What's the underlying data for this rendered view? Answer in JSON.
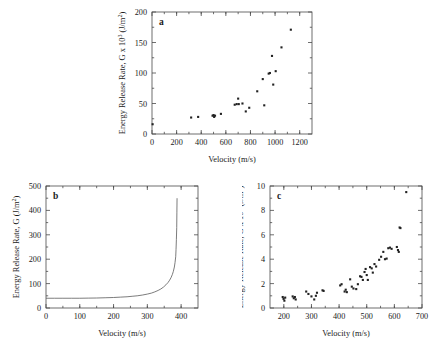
{
  "figure": {
    "background_color": "#ffffff",
    "ink_color": "#1a1a1a",
    "axis_color": "#4a4a4a",
    "panel_count": 3
  },
  "chart_data": [
    {
      "type": "scatter",
      "panel_label": "a",
      "title": "",
      "xlabel": "Velocity (m/s)",
      "ylabel": "Energy Release Rate, G x 10³ (J/m²)",
      "ylabel_parts": {
        "base": "Energy Release Rate, G x 10",
        "exponent": "3",
        "units": " (J/m",
        "units_exponent": "2",
        "units_close": ")"
      },
      "xlim": [
        0,
        1300
      ],
      "ylim": [
        0,
        200
      ],
      "xticks": [
        0,
        200,
        400,
        600,
        800,
        1000,
        1200
      ],
      "yticks": [
        0,
        50,
        100,
        150,
        200
      ],
      "grid": false,
      "legend": "none",
      "marker": "square",
      "points": [
        {
          "x": 5,
          "y": 16
        },
        {
          "x": 318,
          "y": 27
        },
        {
          "x": 375,
          "y": 28
        },
        {
          "x": 492,
          "y": 30
        },
        {
          "x": 500,
          "y": 31
        },
        {
          "x": 505,
          "y": 28
        },
        {
          "x": 512,
          "y": 30
        },
        {
          "x": 560,
          "y": 33
        },
        {
          "x": 672,
          "y": 48
        },
        {
          "x": 688,
          "y": 49
        },
        {
          "x": 700,
          "y": 58
        },
        {
          "x": 705,
          "y": 49
        },
        {
          "x": 735,
          "y": 50
        },
        {
          "x": 762,
          "y": 37
        },
        {
          "x": 790,
          "y": 43
        },
        {
          "x": 855,
          "y": 70
        },
        {
          "x": 900,
          "y": 90
        },
        {
          "x": 912,
          "y": 47
        },
        {
          "x": 948,
          "y": 99
        },
        {
          "x": 958,
          "y": 100
        },
        {
          "x": 975,
          "y": 128
        },
        {
          "x": 985,
          "y": 81
        },
        {
          "x": 1005,
          "y": 103
        },
        {
          "x": 1052,
          "y": 142
        },
        {
          "x": 1128,
          "y": 171
        }
      ]
    },
    {
      "type": "line",
      "panel_label": "b",
      "title": "",
      "xlabel": "Velocity (m/s)",
      "ylabel": "Energy Release Rate, G (J/m²)",
      "ylabel_parts": {
        "base": "Energy Release Rate, G (J/m",
        "units_exponent": "2",
        "units_close": ")"
      },
      "xlim": [
        0,
        450
      ],
      "ylim": [
        0,
        500
      ],
      "xticks": [
        0,
        100,
        200,
        300,
        400
      ],
      "yticks": [
        0,
        100,
        200,
        300,
        400,
        500
      ],
      "grid": false,
      "legend": "none",
      "asymptote_x": 388,
      "baseline_y": 40,
      "x": [
        0,
        25,
        50,
        75,
        100,
        125,
        150,
        175,
        200,
        220,
        240,
        255,
        270,
        285,
        300,
        312,
        322,
        332,
        340,
        348,
        355,
        361,
        366,
        370,
        374,
        377,
        380,
        382,
        384,
        385,
        386,
        387,
        387.5,
        388
      ],
      "y": [
        40,
        40,
        40,
        40,
        40,
        40.5,
        41,
        42,
        43,
        44.5,
        46,
        48,
        50,
        53,
        57,
        61,
        66,
        72,
        78,
        86,
        95,
        104,
        114,
        124,
        137,
        150,
        168,
        186,
        210,
        240,
        280,
        330,
        390,
        450
      ]
    },
    {
      "type": "scatter",
      "panel_label": "c",
      "title": "",
      "xlabel": "Velocity (m/s)",
      "ylabel": "Energy Release Rate, G x 10³ (J/m²)",
      "ylabel_parts": {
        "base": "Energy Release Rate, G x 10",
        "exponent": "3",
        "units": " (J/m",
        "units_exponent": "2",
        "units_close": ")"
      },
      "xlim": [
        150,
        700
      ],
      "ylim": [
        0,
        10
      ],
      "xticks": [
        200,
        300,
        400,
        500,
        600,
        700
      ],
      "yticks": [
        0,
        2,
        4,
        6,
        8,
        10
      ],
      "grid": false,
      "legend": "none",
      "marker": "square",
      "points": [
        {
          "x": 196,
          "y": 0.9
        },
        {
          "x": 199,
          "y": 0.75
        },
        {
          "x": 202,
          "y": 0.6
        },
        {
          "x": 205,
          "y": 0.85
        },
        {
          "x": 232,
          "y": 0.95
        },
        {
          "x": 236,
          "y": 0.8
        },
        {
          "x": 240,
          "y": 0.9
        },
        {
          "x": 243,
          "y": 0.7
        },
        {
          "x": 281,
          "y": 1.35
        },
        {
          "x": 289,
          "y": 1.15
        },
        {
          "x": 300,
          "y": 0.95
        },
        {
          "x": 310,
          "y": 0.7
        },
        {
          "x": 316,
          "y": 1.0
        },
        {
          "x": 320,
          "y": 1.25
        },
        {
          "x": 340,
          "y": 1.45
        },
        {
          "x": 344,
          "y": 1.4
        },
        {
          "x": 404,
          "y": 1.85
        },
        {
          "x": 409,
          "y": 1.95
        },
        {
          "x": 420,
          "y": 1.35
        },
        {
          "x": 424,
          "y": 1.5
        },
        {
          "x": 428,
          "y": 1.3
        },
        {
          "x": 440,
          "y": 2.35
        },
        {
          "x": 446,
          "y": 1.75
        },
        {
          "x": 452,
          "y": 1.6
        },
        {
          "x": 462,
          "y": 1.55
        },
        {
          "x": 468,
          "y": 1.95
        },
        {
          "x": 476,
          "y": 2.6
        },
        {
          "x": 481,
          "y": 2.55
        },
        {
          "x": 486,
          "y": 2.3
        },
        {
          "x": 492,
          "y": 2.95
        },
        {
          "x": 496,
          "y": 3.2
        },
        {
          "x": 500,
          "y": 2.7
        },
        {
          "x": 504,
          "y": 2.3
        },
        {
          "x": 512,
          "y": 3.35
        },
        {
          "x": 518,
          "y": 3.25
        },
        {
          "x": 522,
          "y": 2.9
        },
        {
          "x": 528,
          "y": 3.6
        },
        {
          "x": 534,
          "y": 3.4
        },
        {
          "x": 545,
          "y": 3.95
        },
        {
          "x": 552,
          "y": 4.2
        },
        {
          "x": 560,
          "y": 4.6
        },
        {
          "x": 566,
          "y": 4.0
        },
        {
          "x": 572,
          "y": 4.05
        },
        {
          "x": 578,
          "y": 4.9
        },
        {
          "x": 584,
          "y": 4.95
        },
        {
          "x": 590,
          "y": 4.85
        },
        {
          "x": 609,
          "y": 5.0
        },
        {
          "x": 613,
          "y": 4.75
        },
        {
          "x": 616,
          "y": 4.6
        },
        {
          "x": 619,
          "y": 6.6
        },
        {
          "x": 622,
          "y": 6.55
        },
        {
          "x": 643,
          "y": 9.5
        }
      ]
    }
  ]
}
